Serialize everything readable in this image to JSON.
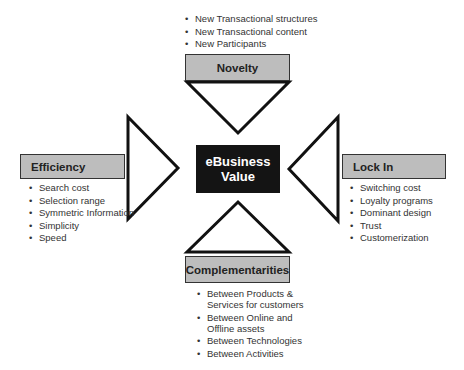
{
  "title": "eBusiness Value",
  "center": {
    "line1": "eBusiness",
    "line2": "Value"
  },
  "nodes": {
    "novelty": {
      "label": "Novelty",
      "items": [
        "New Transactional structures",
        "New Transactional content",
        "New Participants"
      ]
    },
    "efficiency": {
      "label": "Efficiency",
      "items": [
        "Search cost",
        "Selection range",
        "Symmetric Information",
        "Simplicity",
        "Speed"
      ]
    },
    "lock_in": {
      "label": "Lock In",
      "items": [
        "Switching cost",
        "Loyalty programs",
        "Dominant design",
        "Trust",
        "Customerization"
      ]
    },
    "complementarities": {
      "label": "Complementarities",
      "items": [
        [
          "Between Products &",
          "Services for customers"
        ],
        [
          "Between Online and",
          "Offline assets"
        ],
        [
          "Between Technologies"
        ],
        [
          "Between Activities"
        ]
      ]
    }
  },
  "colors": {
    "label_fill": "#bdbdbd",
    "center_fill": "#141414",
    "stroke": "#111111"
  }
}
